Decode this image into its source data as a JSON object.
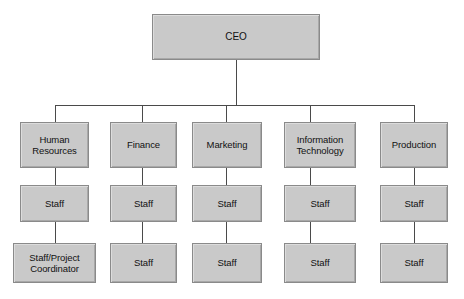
{
  "diagram": {
    "type": "organizational-chart",
    "colors": {
      "node_fill": "#c9c9c9",
      "node_border": "#8a8a8a",
      "connector": "#4a4a4a",
      "text": "#111111",
      "background": "#ffffff"
    },
    "root": {
      "label": "CEO",
      "x": 152,
      "y": 14,
      "width": 168,
      "height": 46
    },
    "bus": {
      "y": 105,
      "x_start": 55,
      "x_end": 414
    },
    "columns": [
      {
        "key": "human-resources",
        "drop_x": 55,
        "levels": [
          {
            "label": "Human\nResources",
            "x": 20,
            "y": 122,
            "width": 69,
            "height": 46
          },
          {
            "label": "Staff",
            "x": 20,
            "y": 185,
            "width": 69,
            "height": 37
          },
          {
            "label": "Staff/Project\nCoordinator",
            "x": 13,
            "y": 243,
            "width": 83,
            "height": 40
          }
        ]
      },
      {
        "key": "finance",
        "drop_x": 142,
        "levels": [
          {
            "label": "Finance",
            "x": 110,
            "y": 122,
            "width": 67,
            "height": 46
          },
          {
            "label": "Staff",
            "x": 110,
            "y": 185,
            "width": 67,
            "height": 37
          },
          {
            "label": "Staff",
            "x": 110,
            "y": 243,
            "width": 67,
            "height": 40
          }
        ]
      },
      {
        "key": "marketing",
        "drop_x": 226,
        "levels": [
          {
            "label": "Marketing",
            "x": 192,
            "y": 122,
            "width": 70,
            "height": 46
          },
          {
            "label": "Staff",
            "x": 192,
            "y": 185,
            "width": 70,
            "height": 37
          },
          {
            "label": "Staff",
            "x": 192,
            "y": 243,
            "width": 70,
            "height": 40
          }
        ]
      },
      {
        "key": "information-technology",
        "drop_x": 310,
        "levels": [
          {
            "label": "Information\nTechnology",
            "x": 284,
            "y": 122,
            "width": 72,
            "height": 46
          },
          {
            "label": "Staff",
            "x": 284,
            "y": 185,
            "width": 72,
            "height": 37
          },
          {
            "label": "Staff",
            "x": 284,
            "y": 243,
            "width": 72,
            "height": 40
          }
        ]
      },
      {
        "key": "production",
        "drop_x": 414,
        "levels": [
          {
            "label": "Production",
            "x": 380,
            "y": 122,
            "width": 68,
            "height": 46
          },
          {
            "label": "Staff",
            "x": 380,
            "y": 185,
            "width": 68,
            "height": 37
          },
          {
            "label": "Staff",
            "x": 380,
            "y": 243,
            "width": 68,
            "height": 40
          }
        ]
      }
    ]
  }
}
